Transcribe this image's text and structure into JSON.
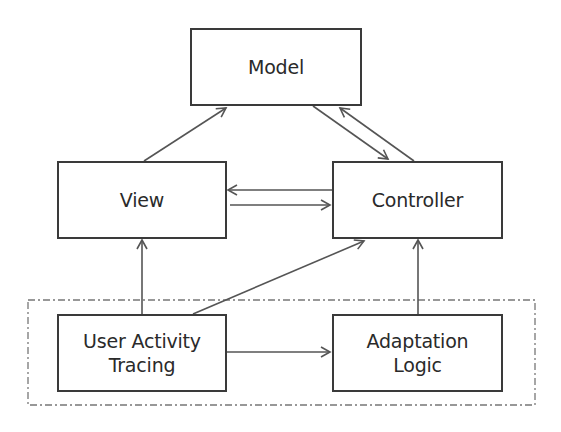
{
  "diagram": {
    "type": "architecture-block-diagram",
    "colors": {
      "stroke": "#3a3a3a",
      "arrow": "#555555",
      "text": "#2a2a2a",
      "background": "#ffffff",
      "group_border": "#777777"
    },
    "nodes": [
      {
        "id": "model",
        "label": "Model"
      },
      {
        "id": "view",
        "label": "View"
      },
      {
        "id": "controller",
        "label": "Controller"
      },
      {
        "id": "user_activity_tracing",
        "label": "User Activity\nTracing"
      },
      {
        "id": "adaptation_logic",
        "label": "Adaptation\nLogic"
      }
    ],
    "edges": [
      {
        "from": "view",
        "to": "model"
      },
      {
        "from": "model",
        "to": "controller"
      },
      {
        "from": "controller",
        "to": "model"
      },
      {
        "from": "controller",
        "to": "view"
      },
      {
        "from": "view",
        "to": "controller"
      },
      {
        "from": "user_activity_tracing",
        "to": "view"
      },
      {
        "from": "user_activity_tracing",
        "to": "controller"
      },
      {
        "from": "adaptation_logic",
        "to": "controller"
      },
      {
        "from": "user_activity_tracing",
        "to": "adaptation_logic"
      }
    ],
    "groups": [
      {
        "id": "adaptation_layer",
        "style": "dash-dot",
        "members": [
          "user_activity_tracing",
          "adaptation_logic"
        ]
      }
    ]
  }
}
